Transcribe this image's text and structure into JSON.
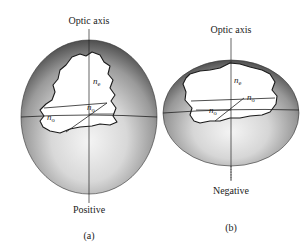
{
  "figure": {
    "panels": [
      {
        "id": "a",
        "caption": "(a)",
        "shape": "prolate ellipsoid",
        "axis_label": "Optic axis",
        "sign_label": "Positive",
        "labels": {
          "ne": "n",
          "ne_sub": "e",
          "no_right": "n",
          "no_right_sub": "o",
          "no_left": "n",
          "no_left_sub": "o"
        }
      },
      {
        "id": "b",
        "caption": "(b)",
        "shape": "oblate ellipsoid",
        "axis_label": "Optic axis",
        "sign_label": "Negative",
        "labels": {
          "ne": "n",
          "ne_sub": "e",
          "no_right": "n",
          "no_right_sub": "o",
          "no_left": "n",
          "no_left_sub": "o"
        }
      }
    ],
    "colors": {
      "shell_dark": "#5a5a5a",
      "shell_mid": "#9a9a9a",
      "shell_light": "#f2f2f2",
      "outline": "#222222",
      "cutout": "#ffffff"
    }
  }
}
